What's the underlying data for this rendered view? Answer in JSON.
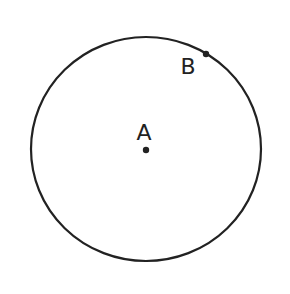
{
  "diagram": {
    "type": "geometry-circle",
    "circle": {
      "cx": 146,
      "cy": 149,
      "rx": 115,
      "ry": 112,
      "stroke": "#222222",
      "stroke_width": 2.2
    },
    "points": [
      {
        "id": "A",
        "label": "A",
        "x": 146,
        "y": 150,
        "label_x": 144,
        "label_y": 140,
        "role": "center"
      },
      {
        "id": "B",
        "label": "B",
        "x": 206,
        "y": 54,
        "label_x": 188,
        "label_y": 74,
        "role": "on-circle"
      }
    ],
    "colors": {
      "ink": "#222222",
      "background": "#ffffff"
    }
  }
}
